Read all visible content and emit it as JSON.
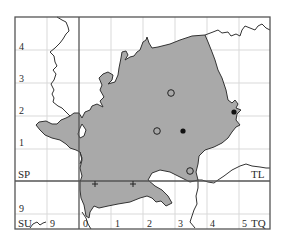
{
  "map": {
    "type": "distribution-map",
    "grid_squares": {
      "top_left": "SP",
      "top_right": "TL",
      "bottom_left": "SU",
      "bottom_right": "TQ"
    },
    "left_axis_labels": [
      "4",
      "3",
      "2",
      "1",
      "9"
    ],
    "bottom_axis_labels": [
      "9",
      "0",
      "1",
      "2",
      "3",
      "4",
      "5"
    ],
    "colors": {
      "region_fill": "#a8a8a8",
      "region_stroke": "#3a3a3a",
      "grid_major": "#555555",
      "grid_minor": "#d8d8d8",
      "river": "#3a3a3a"
    },
    "legend_symbols": {
      "open_circle": "record (older)",
      "filled_circle": "record (recent)",
      "cross": "record (other)"
    },
    "records": [
      {
        "symbol": "open_circle",
        "x": 171,
        "y": 93
      },
      {
        "symbol": "open_circle",
        "x": 157,
        "y": 131
      },
      {
        "symbol": "filled_circle",
        "x": 183,
        "y": 131
      },
      {
        "symbol": "filled_circle",
        "x": 234,
        "y": 112
      },
      {
        "symbol": "open_circle",
        "x": 190,
        "y": 171
      },
      {
        "symbol": "cross",
        "x": 95,
        "y": 184
      },
      {
        "symbol": "cross",
        "x": 133,
        "y": 184
      }
    ]
  }
}
